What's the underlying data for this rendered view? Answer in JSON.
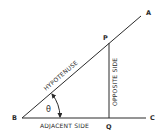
{
  "diagram": {
    "type": "right-triangle-trigonometry",
    "points": {
      "A": {
        "label": "A"
      },
      "B": {
        "label": "B"
      },
      "C": {
        "label": "C"
      },
      "P": {
        "label": "P"
      },
      "Q": {
        "label": "Q"
      }
    },
    "sides": {
      "hypotenuse": "HYPOTENUSE",
      "opposite": "OPPOSITE SIDE",
      "adjacent": "ADJACENT SIDE"
    },
    "angle": {
      "symbol": "θ"
    },
    "colors": {
      "line": "#2a2a2a",
      "background": "#ffffff"
    }
  }
}
